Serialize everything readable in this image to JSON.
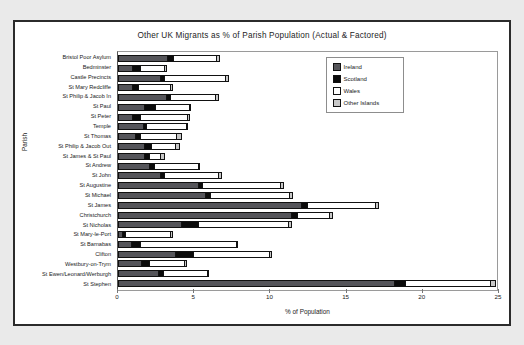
{
  "chart_panel": {
    "title": "Other UK Migrants as % of Parish Population (Actual & Factored)"
  },
  "axes": {
    "x_title": "% of Population",
    "y_title": "Parish",
    "x_ticks": [
      "0",
      "5",
      "10",
      "15",
      "20",
      "25"
    ],
    "x_min": 0,
    "x_max": 25
  },
  "legend": {
    "items": [
      {
        "label": "Ireland",
        "color": "#55555a"
      },
      {
        "label": "Scotland",
        "color": "#0b0b0b"
      },
      {
        "label": "Wales",
        "color": "#ffffff"
      },
      {
        "label": "Other Islands",
        "color": "#c9c9c9"
      }
    ]
  },
  "chart_data": {
    "type": "bar",
    "orientation": "horizontal",
    "stacked": true,
    "title": "Other UK Migrants as % of Parish Population (Actual & Factored)",
    "xlabel": "% of Population",
    "ylabel": "Parish",
    "xlim": [
      0,
      25
    ],
    "xticks": [
      0,
      5,
      10,
      15,
      20,
      25
    ],
    "grid": false,
    "legend_position": "top-right",
    "categories": [
      "Bristol Poor Asylum",
      "Bedminster",
      "Castle Precincts",
      "St Mary Redcliffe",
      "St Philip & Jacob In",
      "St Paul",
      "St Peter",
      "Temple",
      "St Thomas",
      "St Philip & Jacob Out",
      "St James & St Paul",
      "St Andrew",
      "St John",
      "St Augustine",
      "St Michael",
      "St James",
      "Christchurch",
      "St Nicholas",
      "St Mary-le-Port",
      "St Barnabas",
      "Clifton",
      "Westbury-on-Trym",
      "St Ewen/Leonard/Werburgh",
      "St Stephen"
    ],
    "series": [
      {
        "name": "Ireland",
        "color": "#55555a",
        "values": [
          3.3,
          1.0,
          2.8,
          1.0,
          3.2,
          1.8,
          1.0,
          1.7,
          1.2,
          1.8,
          1.8,
          2.1,
          2.8,
          5.3,
          5.8,
          12.1,
          11.4,
          4.2,
          0.3,
          0.9,
          3.8,
          1.6,
          2.7,
          18.2
        ]
      },
      {
        "name": "Scotland",
        "color": "#0b0b0b",
        "values": [
          0.4,
          0.5,
          0.3,
          0.4,
          0.3,
          0.7,
          0.5,
          0.2,
          0.3,
          0.4,
          0.3,
          0.3,
          0.3,
          0.3,
          0.3,
          0.4,
          0.4,
          1.1,
          0.2,
          0.6,
          1.2,
          0.5,
          0.3,
          0.7
        ]
      },
      {
        "name": "Wales",
        "color": "#ffffff",
        "values": [
          2.8,
          1.6,
          4.0,
          2.1,
          2.9,
          2.2,
          3.1,
          2.6,
          2.4,
          1.6,
          0.7,
          2.9,
          3.5,
          5.1,
          5.2,
          4.4,
          2.1,
          5.9,
          3.0,
          6.3,
          5.0,
          2.3,
          2.9,
          5.6
        ]
      },
      {
        "name": "Other Islands",
        "color": "#c9c9c9",
        "values": [
          0.2,
          0.1,
          0.2,
          0.1,
          0.2,
          0.1,
          0.1,
          0.1,
          0.3,
          0.3,
          0.3,
          0.1,
          0.2,
          0.2,
          0.2,
          0.2,
          0.2,
          0.2,
          0.1,
          0.1,
          0.1,
          0.1,
          0.1,
          0.3
        ]
      }
    ]
  }
}
